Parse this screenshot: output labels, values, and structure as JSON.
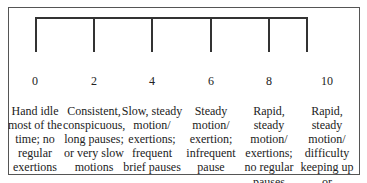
{
  "scale": {
    "levels": [
      {
        "value": "0",
        "description": "Hand idle\nmost of the\ntime; no\nregular\nexertions"
      },
      {
        "value": "2",
        "description": "Consistent,\nconspicuous,\nlong pauses;\nor very slow\nmotions"
      },
      {
        "value": "4",
        "description": "Slow, steady\nmotion/\nexertions;\nfrequent\nbrief pauses"
      },
      {
        "value": "6",
        "description": "Steady\nmotion/\nexertion;\ninfrequent\npause"
      },
      {
        "value": "8",
        "description": "Rapid, steady\nmotion/\nexertions;\nno regular\npauses"
      },
      {
        "value": "10",
        "description": "Rapid, steady\nmotion/\ndifficulty\nkeeping up or\ncontinuous\nexertion"
      }
    ]
  }
}
